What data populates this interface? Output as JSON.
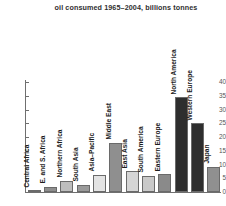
{
  "chart_data": {
    "type": "bar",
    "title": "oil consumed 1965–2004, billions tonnes",
    "xlabel": "",
    "ylabel": "",
    "ylim": [
      0,
      40
    ],
    "ytick_labels": [
      "0",
      "5",
      "10",
      "15",
      "20",
      "25",
      "30",
      "35",
      "40"
    ],
    "yticks": [
      0,
      5,
      10,
      15,
      20,
      25,
      30,
      35,
      40
    ],
    "grid": false,
    "legend": "none",
    "categories": [
      "Central Africa",
      "E. and S. Africa",
      "Northern Africa",
      "South Asia",
      "Asia–Pacific",
      "Middle East",
      "East Asia",
      "South America",
      "Eastern Europe",
      "North America",
      "Western Europe",
      "Japan"
    ],
    "values": [
      0.5,
      1.8,
      4.0,
      2.6,
      6.3,
      18.0,
      7.5,
      6.0,
      6.5,
      34.5,
      25.0,
      9.2
    ],
    "bar_colors": [
      "#e9e9e9",
      "#8e8e8e",
      "#bdbdbd",
      "#9a9a9a",
      "#e3e3e3",
      "#8f8f8f",
      "#d5d5d5",
      "#c9c9c9",
      "#8a8a8a",
      "#2e2e2e",
      "#2e2e2e",
      "#909090"
    ]
  }
}
